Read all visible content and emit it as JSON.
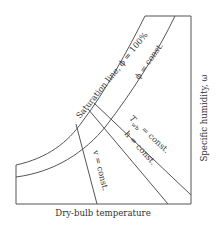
{
  "diagram": {
    "x_axis_label": "Dry-bulb temperature",
    "y_axis_label": "Specific humidity, ω",
    "curves": {
      "saturation": "Saturation line, ϕ = 100%",
      "phi_const": "ϕ = const.",
      "twb_const_T": "T",
      "twb_const_sub": "wb",
      "twb_const_rest": " = const.",
      "h_const": "h = const.",
      "v_const": "v = const."
    },
    "colors": {
      "line": "#555555",
      "text": "#333333",
      "background": "#ffffff"
    }
  }
}
